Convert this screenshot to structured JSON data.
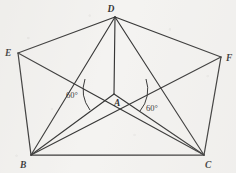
{
  "figure": {
    "background_color": "#f4f3f1",
    "stroke_color": "#1a1a1a",
    "viewbox": "0 0 236 173",
    "points": {
      "A": {
        "label": "A",
        "x": 114,
        "y": 94,
        "label_x": 117,
        "label_y": 103
      },
      "B": {
        "label": "B",
        "x": 31,
        "y": 155,
        "label_x": 24,
        "label_y": 166
      },
      "C": {
        "label": "C",
        "x": 204,
        "y": 155,
        "label_x": 207,
        "label_y": 166
      },
      "D": {
        "label": "D",
        "x": 115,
        "y": 17,
        "label_x": 112,
        "label_y": 11
      },
      "E": {
        "label": "E",
        "x": 18,
        "y": 53,
        "label_x": 6,
        "label_y": 52
      },
      "F": {
        "label": "F",
        "x": 221,
        "y": 57,
        "label_x": 226,
        "label_y": 57
      }
    },
    "outline_segments": [
      {
        "name": "edge-E-D",
        "from": "E",
        "to": "D"
      },
      {
        "name": "edge-D-F",
        "from": "D",
        "to": "F"
      },
      {
        "name": "edge-F-C",
        "from": "F",
        "to": "C"
      },
      {
        "name": "edge-C-B",
        "from": "C",
        "to": "B"
      },
      {
        "name": "edge-B-E",
        "from": "B",
        "to": "E"
      }
    ],
    "interior_segments": [
      {
        "name": "segment-D-A",
        "from": "D",
        "to": "A"
      },
      {
        "name": "segment-A-B",
        "from": "A",
        "to": "B"
      },
      {
        "name": "segment-A-C",
        "from": "A",
        "to": "C"
      },
      {
        "name": "segment-E-C",
        "from": "E",
        "to": "C"
      },
      {
        "name": "segment-F-B",
        "from": "F",
        "to": "B"
      },
      {
        "name": "segment-D-B",
        "from": "D",
        "to": "B"
      },
      {
        "name": "segment-D-C",
        "from": "D",
        "to": "C"
      }
    ],
    "angle_marks": [
      {
        "name": "angle-left-60",
        "text": "60°",
        "value": 60,
        "unit": "degrees",
        "vertex": "A",
        "label_x": 78,
        "label_y": 97,
        "arc_path": "M 85 79 A 34 34 0 0 0 90 110"
      },
      {
        "name": "angle-right-60",
        "text": "60°",
        "value": 60,
        "unit": "degrees",
        "vertex": "A",
        "label_x": 149,
        "label_y": 109,
        "arc_path": "M 140 111 A 33 33 0 0 0 146 79"
      }
    ]
  }
}
